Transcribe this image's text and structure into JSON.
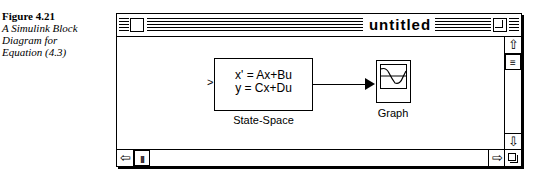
{
  "caption": {
    "figure": "Figure 4.21",
    "description_lines": [
      "A Simulink Block",
      "Diagram for",
      "Equation (4.3)"
    ]
  },
  "window": {
    "title": "untitled"
  },
  "diagram": {
    "state_space": {
      "eq1": "x' = Ax+Bu",
      "eq2": "y = Cx+Du",
      "label": "State-Space",
      "input_port": ">"
    },
    "graph": {
      "label": "Graph"
    }
  },
  "scrollbars": {
    "up": "⇧",
    "down": "⇩",
    "left": "⇦",
    "right": "⇨",
    "vthumb": "≡",
    "hthumb": "|||"
  }
}
